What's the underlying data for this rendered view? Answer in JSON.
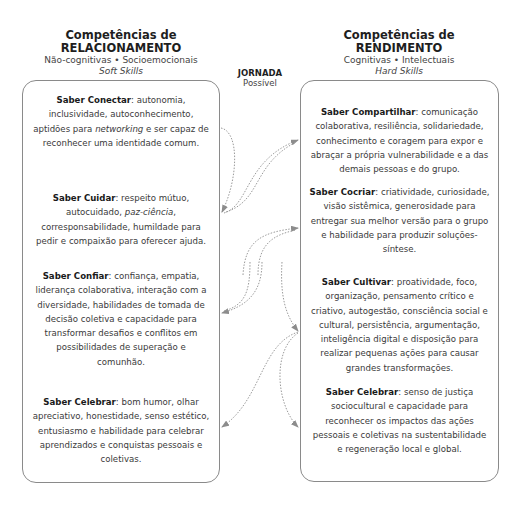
{
  "left_column": {
    "title_line1": "Competências de",
    "title_line2": "RELACIONAMENTO",
    "subtitle": "Não-cognitivas • Socioemocionais",
    "subtitle_italic": "Soft Skills",
    "items": [
      {
        "label": "Saber Conectar",
        "pre": ": autonomia, inclusividade, autoconhecimento, aptidões para ",
        "em": "networking",
        "post": " e ser capaz de reconhecer uma identidade comum."
      },
      {
        "label": "Saber Cuidar",
        "pre": ": respeito mútuo, autocuidado, ",
        "em": "paz-ciência",
        "post": ", corresponsabilidade, humildade para pedir e compaixão para oferecer ajuda."
      },
      {
        "label": "Saber Confiar",
        "pre": ": confiança, empatia, liderança colaborativa, interação com a diversidade, habilidades de tomada de decisão coletiva e capacidade para transformar desafios e conflitos em possibilidades de superação e comunhão.",
        "em": "",
        "post": ""
      },
      {
        "label": "Saber Celebrar",
        "pre": ": bom humor, olhar apreciativo, honestidade, senso estético, entusiasmo e habilidade para celebrar aprendizados e conquistas pessoais e coletivas.",
        "em": "",
        "post": ""
      }
    ]
  },
  "center": {
    "title": "JORNADA",
    "subtitle": "Possível"
  },
  "right_column": {
    "title_line1": "Competências de",
    "title_line2": "RENDIMENTO",
    "subtitle": "Cognitivas • Intelectuais",
    "subtitle_italic": "Hard Skills",
    "items": [
      {
        "label": "Saber Compartilhar",
        "pre": ": comunicação colaborativa, resiliência, solidariedade, conhecimento e coragem para expor e abraçar a própria vulnerabilidade e a das demais pessoas e do grupo.",
        "em": "",
        "post": ""
      },
      {
        "label": "Saber Cocriar",
        "pre": ": criatividade, curiosidade, visão sistêmica, generosidade para entregar sua melhor versão para o grupo e habilidade para produzir soluções-síntese.",
        "em": "",
        "post": ""
      },
      {
        "label": "Saber Cultivar",
        "pre": ": proatividade, foco, organização, pensamento crítico e criativo, autogestão, consciência social e cultural, persistência, argumentação, inteligência digital e disposição para realizar pequenas ações para causar grandes transformações.",
        "em": "",
        "post": ""
      },
      {
        "label": "Saber Celebrar",
        "pre": ": senso de justiça sociocultural e capacidade para reconhecer os impactos das ações pessoais e coletivas na sustentabilidade e regeneração local e global.",
        "em": "",
        "post": ""
      }
    ]
  },
  "colors": {
    "border": "#8a8a8a",
    "arrow": "#8c8c8c",
    "text": "#3a3a3a",
    "heading": "#1e1e1e"
  }
}
